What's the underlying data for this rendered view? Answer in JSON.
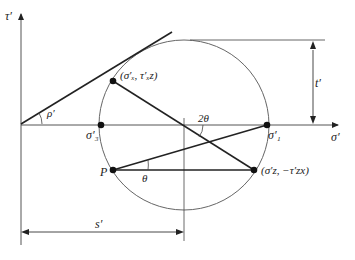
{
  "diagram": {
    "axes": {
      "y_label": "τ′",
      "x_label": "σ′"
    },
    "labels": {
      "rho": "ρ′",
      "two_theta": "2θ",
      "theta": "θ",
      "pole": "P",
      "sigma3": "σ′₃",
      "sigma1": "σ′₁",
      "point_x": "(σ′ₓ, τ′ₓz)",
      "point_z": "(σ′z, −τ′zx)",
      "t_dim": "t′",
      "s_dim": "s′"
    },
    "colors": {
      "line": "#222222",
      "circle": "#555555",
      "thin": "#444444"
    }
  }
}
